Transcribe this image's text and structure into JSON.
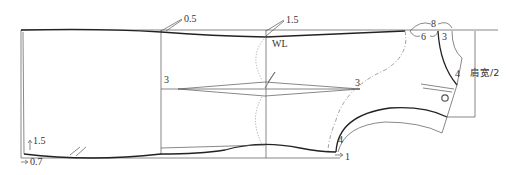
{
  "diagram": {
    "type": "garment-pattern",
    "labels": {
      "hem_top_raise": "0.5",
      "waist_raise": "1.5",
      "waist_line": "WL",
      "dart_left_offset": "3",
      "dart_right_offset": "3",
      "neck_total": "8",
      "neck_width": "6",
      "neck_depth": "3",
      "shoulder_drop": "4",
      "shoulder_width": "肩宽/2",
      "underarm_offset": "4",
      "armhole_shift": "1",
      "hem_raise": "1.5",
      "hem_shift": "0.7"
    }
  }
}
